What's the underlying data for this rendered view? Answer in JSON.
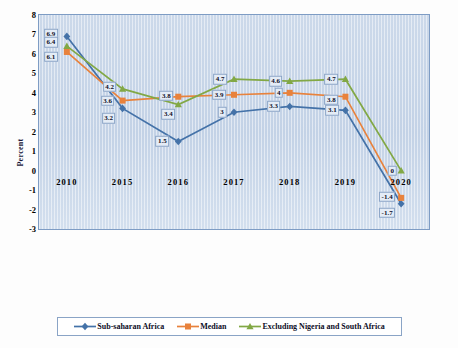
{
  "chart_data": {
    "type": "line",
    "title": "",
    "xlabel": "",
    "ylabel": "Percent",
    "grid": false,
    "legend_position": "bottom",
    "categories": [
      "2010",
      "2015",
      "2016",
      "2017",
      "2018",
      "2019",
      "2020"
    ],
    "ylim": [
      -3,
      8
    ],
    "ytick_labels": [
      "8",
      "7",
      "6",
      "5",
      "4",
      "3",
      "2",
      "1",
      "0",
      "-1",
      "-2",
      "-3"
    ],
    "ytick_values": [
      8,
      7,
      6,
      5,
      4,
      3,
      2,
      1,
      0,
      -1,
      -2,
      -3
    ],
    "series": [
      {
        "name": "Sub-saharan Africa",
        "color": "#4472a8",
        "marker": "diamond",
        "values": [
          6.9,
          3.2,
          1.5,
          3,
          3.3,
          3.1,
          -1.7
        ],
        "labels": [
          "6.9",
          "3.2",
          "1.5",
          "3",
          "3.3",
          "3.1",
          "-1.7"
        ]
      },
      {
        "name": "Median",
        "color": "#e8823c",
        "marker": "square",
        "values": [
          6.1,
          3.6,
          3.8,
          3.9,
          4,
          3.8,
          -1.4
        ],
        "labels": [
          "6.1",
          "3.6",
          "3.8",
          "3.9",
          "4",
          "3.8",
          "-1.4"
        ]
      },
      {
        "name": "Excluding Nigeria and South Africa",
        "color": "#82a845",
        "marker": "triangle",
        "values": [
          6.4,
          4.2,
          3.4,
          4.7,
          4.6,
          4.7,
          0
        ],
        "labels": [
          "6.4",
          "4.2",
          "3.4",
          "4.7",
          "4.6",
          "4.7",
          "0"
        ]
      }
    ]
  },
  "axis": {
    "y_title": "Percent"
  },
  "legend": {
    "items": [
      {
        "label": "Sub-saharan Africa"
      },
      {
        "label": "Median"
      },
      {
        "label": "Excluding Nigeria and South Africa"
      }
    ]
  }
}
